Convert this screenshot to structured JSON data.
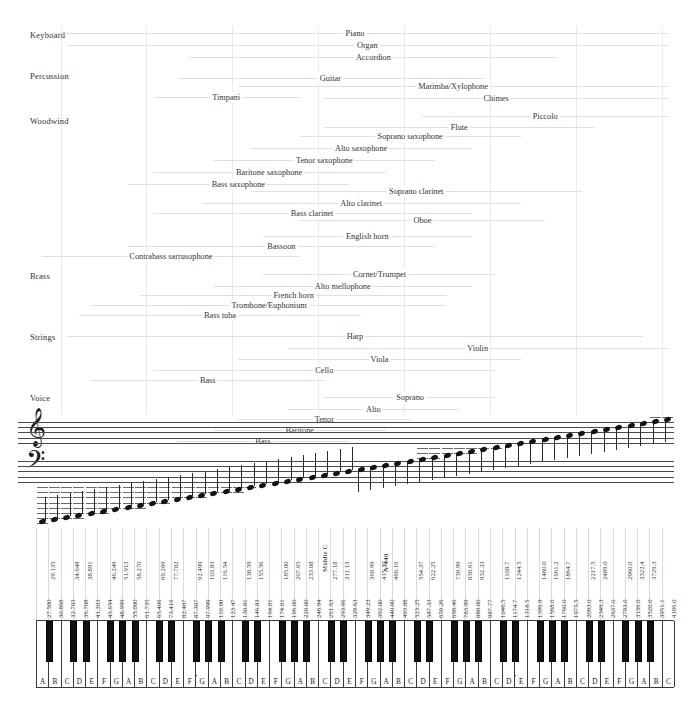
{
  "chart_data": {
    "type": "table",
    "xlabel": "Pitch (piano keys A0–C8)",
    "ylabel": "Instrument family",
    "grid": true,
    "legend": "none",
    "categories_axis": [
      "Keyboard",
      "Percussion",
      "Woodwind",
      "Brass",
      "Strings",
      "Voice"
    ],
    "key_count_white": 52,
    "key_range": [
      "A0",
      "C8"
    ],
    "reference_markers": [
      "Middle C",
      "A-440"
    ],
    "white_key_frequencies_hz": [
      27.5,
      30.868,
      32.703,
      36.708,
      41.203,
      43.654,
      48.999,
      55.0,
      61.735,
      65.406,
      73.416,
      82.407,
      87.307,
      97.999,
      110.0,
      123.47,
      130.81,
      146.83,
      164.81,
      174.61,
      196.0,
      220.0,
      246.94,
      261.63,
      293.66,
      329.63,
      349.23,
      392.0,
      440.0,
      493.88,
      523.25,
      587.33,
      659.26,
      698.46,
      783.99,
      880.0,
      987.77,
      1046.5,
      1174.7,
      1318.5,
      1396.9,
      1568.0,
      1760.0,
      1975.5,
      2093.0,
      2349.3,
      2637.0,
      2793.0,
      3136.0,
      3520.0,
      3951.1,
      4186.0
    ],
    "black_key_frequencies_hz": [
      29.135,
      34.648,
      38.891,
      46.249,
      51.913,
      58.27,
      69.269,
      77.782,
      92.499,
      103.83,
      116.54,
      138.59,
      155.56,
      185.0,
      207.65,
      233.08,
      277.18,
      311.13,
      369.99,
      415.3,
      466.16,
      554.37,
      622.25,
      739.99,
      830.61,
      932.33,
      1108.7,
      1244.5,
      1480.0,
      1661.2,
      1864.7,
      2217.5,
      2489.0,
      2960.0,
      3322.4,
      3729.3
    ],
    "note_letters_sequence": [
      "A",
      "B",
      "C",
      "D",
      "E",
      "F",
      "G",
      "A",
      "B",
      "C",
      "D",
      "E",
      "F",
      "G",
      "A",
      "B",
      "C",
      "D",
      "E",
      "F",
      "G",
      "A",
      "B",
      "C",
      "D",
      "E",
      "F",
      "G",
      "A",
      "B",
      "C",
      "D",
      "E",
      "F",
      "G",
      "A",
      "B",
      "C",
      "D",
      "E",
      "F",
      "G",
      "A",
      "B",
      "C",
      "D",
      "E",
      "F",
      "G",
      "A",
      "B",
      "C"
    ],
    "instrument_ranges": [
      {
        "name": "Piano",
        "category": "Keyboard",
        "low": "A0",
        "high": "C8",
        "low_hz": 27.5,
        "high_hz": 4186.0
      },
      {
        "name": "Organ",
        "category": "Keyboard",
        "low": "C1",
        "high": "C8",
        "low_hz": 32.7,
        "high_hz": 4186.0
      },
      {
        "name": "Accordion",
        "category": "Keyboard",
        "low": "F2",
        "high": "A6",
        "low_hz": 87.3,
        "high_hz": 1760.0
      },
      {
        "name": "Guitar",
        "category": "Percussion",
        "low": "E2",
        "high": "B5",
        "low_hz": 82.4,
        "high_hz": 987.8
      },
      {
        "name": "Marimba/Xylophone",
        "category": "Percussion",
        "low": "C3",
        "high": "C8",
        "low_hz": 130.8,
        "high_hz": 4186.0
      },
      {
        "name": "Chimes",
        "category": "Percussion",
        "low": "C4",
        "high": "C8",
        "low_hz": 261.6,
        "high_hz": 4186.0
      },
      {
        "name": "Timpani",
        "category": "Percussion",
        "low": "D2",
        "high": "A3",
        "low_hz": 73.4,
        "high_hz": 220.0
      },
      {
        "name": "Piccolo",
        "category": "Woodwind",
        "low": "D5",
        "high": "C8",
        "low_hz": 587.3,
        "high_hz": 4186.0
      },
      {
        "name": "Flute",
        "category": "Woodwind",
        "low": "C4",
        "high": "D7",
        "low_hz": 261.6,
        "high_hz": 2349.3
      },
      {
        "name": "Soprano saxophone",
        "category": "Woodwind",
        "low": "A3",
        "high": "E6",
        "low_hz": 220.0,
        "high_hz": 1318.5
      },
      {
        "name": "Alto saxophone",
        "category": "Woodwind",
        "low": "D3",
        "high": "A5",
        "low_hz": 146.8,
        "high_hz": 880.0
      },
      {
        "name": "Tenor saxophone",
        "category": "Woodwind",
        "low": "A2",
        "high": "E5",
        "low_hz": 110.0,
        "high_hz": 659.3
      },
      {
        "name": "Baritone saxophone",
        "category": "Woodwind",
        "low": "D2",
        "high": "A4",
        "low_hz": 73.4,
        "high_hz": 440.0
      },
      {
        "name": "Bass saxophone",
        "category": "Woodwind",
        "low": "A1",
        "high": "E4",
        "low_hz": 55.0,
        "high_hz": 329.6
      },
      {
        "name": "Soprano clarinet",
        "category": "Woodwind",
        "low": "D3",
        "high": "C7",
        "low_hz": 146.8,
        "high_hz": 2093.0
      },
      {
        "name": "Alto clarinet",
        "category": "Woodwind",
        "low": "G2",
        "high": "E6",
        "low_hz": 98.0,
        "high_hz": 1318.5
      },
      {
        "name": "Bass clarinet",
        "category": "Woodwind",
        "low": "D2",
        "high": "A5",
        "low_hz": 73.4,
        "high_hz": 880.0
      },
      {
        "name": "Oboe",
        "category": "Woodwind",
        "low": "A3",
        "high": "G6",
        "low_hz": 220.0,
        "high_hz": 1568.0
      },
      {
        "name": "English horn",
        "category": "Woodwind",
        "low": "E3",
        "high": "A5",
        "low_hz": 164.8,
        "high_hz": 880.0
      },
      {
        "name": "Bassoon",
        "category": "Woodwind",
        "low": "A1",
        "high": "E5",
        "low_hz": 55.0,
        "high_hz": 659.3
      },
      {
        "name": "Contrabass sarrusophone",
        "category": "Woodwind",
        "low": "A0",
        "high": "A3",
        "low_hz": 27.5,
        "high_hz": 220.0
      },
      {
        "name": "Cornet/Trumpet",
        "category": "Brass",
        "low": "E3",
        "high": "C6",
        "low_hz": 164.8,
        "high_hz": 1046.5
      },
      {
        "name": "Alto mellophone",
        "category": "Brass",
        "low": "A2",
        "high": "A5",
        "low_hz": 110.0,
        "high_hz": 880.0
      },
      {
        "name": "French horn",
        "category": "Brass",
        "low": "B1",
        "high": "F5",
        "low_hz": 61.7,
        "high_hz": 698.5
      },
      {
        "name": "Trombone/Euphonium",
        "category": "Brass",
        "low": "E1",
        "high": "F5",
        "low_hz": 41.2,
        "high_hz": 698.5
      },
      {
        "name": "Bass tuba",
        "category": "Brass",
        "low": "D1",
        "high": "F4",
        "low_hz": 36.7,
        "high_hz": 349.2
      },
      {
        "name": "Harp",
        "category": "Strings",
        "low": "C1",
        "high": "G7",
        "low_hz": 32.7,
        "high_hz": 3136.0
      },
      {
        "name": "Violin",
        "category": "Strings",
        "low": "G3",
        "high": "C8",
        "low_hz": 196.0,
        "high_hz": 4186.0
      },
      {
        "name": "Viola",
        "category": "Strings",
        "low": "C3",
        "high": "E6",
        "low_hz": 130.8,
        "high_hz": 1318.5
      },
      {
        "name": "Cello",
        "category": "Strings",
        "low": "C2",
        "high": "C6",
        "low_hz": 65.4,
        "high_hz": 1046.5
      },
      {
        "name": "Bass",
        "category": "Strings",
        "low": "E1",
        "high": "C4",
        "low_hz": 41.2,
        "high_hz": 261.6
      },
      {
        "name": "Soprano",
        "category": "Voice",
        "low": "C4",
        "high": "C6",
        "low_hz": 261.6,
        "high_hz": 1046.5
      },
      {
        "name": "Alto",
        "category": "Voice",
        "low": "G3",
        "high": "G5",
        "low_hz": 196.0,
        "high_hz": 784.0
      },
      {
        "name": "Tenor",
        "category": "Voice",
        "low": "C3",
        "high": "C5",
        "low_hz": 130.8,
        "high_hz": 523.3
      },
      {
        "name": "Baritone",
        "category": "Voice",
        "low": "A2",
        "high": "A4",
        "low_hz": 110.0,
        "high_hz": 440.0
      },
      {
        "name": "Bass",
        "category": "Voice",
        "low": "E2",
        "high": "E4",
        "low_hz": 82.4,
        "high_hz": 329.6
      }
    ]
  },
  "categories": [
    {
      "label": "Keyboard",
      "top": 30
    },
    {
      "label": "Percussion",
      "top": 71
    },
    {
      "label": "Woodwind",
      "top": 116
    },
    {
      "label": "Brass",
      "top": 271
    },
    {
      "label": "Strings",
      "top": 332
    },
    {
      "label": "Voice",
      "top": 393
    }
  ],
  "ranges": [
    {
      "name": "Piano",
      "top": 28,
      "a": 0,
      "b": 51
    },
    {
      "name": "Organ",
      "top": 40,
      "a": 2,
      "b": 51
    },
    {
      "name": "Accordion",
      "top": 52,
      "a": 12,
      "b": 42
    },
    {
      "name": "Guitar",
      "top": 73,
      "a": 11,
      "b": 36
    },
    {
      "name": "Marimba/Xylophone",
      "top": 81,
      "a": 16,
      "b": 51
    },
    {
      "name": "Chimes",
      "top": 93,
      "a": 23,
      "b": 51
    },
    {
      "name": "Timpani",
      "top": 92,
      "a": 9,
      "b": 21
    },
    {
      "name": "Piccolo",
      "top": 111,
      "a": 31,
      "b": 51
    },
    {
      "name": "Flute",
      "top": 122,
      "a": 23,
      "b": 45
    },
    {
      "name": "Soprano saxophone",
      "top": 131,
      "a": 21,
      "b": 39
    },
    {
      "name": "Alto saxophone",
      "top": 143,
      "a": 17,
      "b": 35
    },
    {
      "name": "Tenor saxophone",
      "top": 155,
      "a": 14,
      "b": 32
    },
    {
      "name": "Baritone saxophone",
      "top": 167,
      "a": 9,
      "b": 28
    },
    {
      "name": "Bass saxophone",
      "top": 179,
      "a": 7,
      "b": 25
    },
    {
      "name": "Soprano clarinet",
      "top": 186,
      "a": 17,
      "b": 44
    },
    {
      "name": "Alto clarinet",
      "top": 198,
      "a": 13,
      "b": 39
    },
    {
      "name": "Bass clarinet",
      "top": 208,
      "a": 9,
      "b": 35
    },
    {
      "name": "Oboe",
      "top": 215,
      "a": 21,
      "b": 41
    },
    {
      "name": "English horn",
      "top": 231,
      "a": 18,
      "b": 35
    },
    {
      "name": "Bassoon",
      "top": 241,
      "a": 7,
      "b": 32
    },
    {
      "name": "Contrabass sarrusophone",
      "top": 251,
      "a": 0,
      "b": 21
    },
    {
      "name": "Cornet/Trumpet",
      "top": 269,
      "a": 18,
      "b": 37
    },
    {
      "name": "Alto mellophone",
      "top": 281,
      "a": 14,
      "b": 35
    },
    {
      "name": "French horn",
      "top": 290,
      "a": 8,
      "b": 33
    },
    {
      "name": "Trombone/Euphonium",
      "top": 300,
      "a": 4,
      "b": 33
    },
    {
      "name": "Bass tuba",
      "top": 310,
      "a": 3,
      "b": 26
    },
    {
      "name": "Harp",
      "top": 331,
      "a": 2,
      "b": 49
    },
    {
      "name": "Violin",
      "top": 343,
      "a": 20,
      "b": 51
    },
    {
      "name": "Viola",
      "top": 354,
      "a": 16,
      "b": 39
    },
    {
      "name": "Cello",
      "top": 365,
      "a": 9,
      "b": 37
    },
    {
      "name": "Bass",
      "top": 375,
      "a": 4,
      "b": 23
    },
    {
      "name": "Soprano",
      "top": 392,
      "a": 23,
      "b": 37
    },
    {
      "name": "Alto",
      "top": 404,
      "a": 20,
      "b": 34
    },
    {
      "name": "Tenor",
      "top": 414,
      "a": 16,
      "b": 30
    },
    {
      "name": "Baritone",
      "top": 425,
      "a": 14,
      "b": 28
    },
    {
      "name": "Bass",
      "top": 436,
      "a": 11,
      "b": 25
    }
  ],
  "staff": {
    "treble_clef_glyph": "𝄞",
    "bass_clef_glyph": "𝄢"
  },
  "markers": {
    "middle_c": "Middle C",
    "a440": "A-440"
  },
  "white_keys": [
    {
      "letter": "A",
      "hz": "27.500"
    },
    {
      "letter": "B",
      "hz": "30.868"
    },
    {
      "letter": "C",
      "hz": "32.703"
    },
    {
      "letter": "D",
      "hz": "36.708"
    },
    {
      "letter": "E",
      "hz": "41.203"
    },
    {
      "letter": "F",
      "hz": "43.654"
    },
    {
      "letter": "G",
      "hz": "48.999"
    },
    {
      "letter": "A",
      "hz": "55.000"
    },
    {
      "letter": "B",
      "hz": "61.735"
    },
    {
      "letter": "C",
      "hz": "65.406"
    },
    {
      "letter": "D",
      "hz": "73.416"
    },
    {
      "letter": "E",
      "hz": "82.407"
    },
    {
      "letter": "F",
      "hz": "87.307"
    },
    {
      "letter": "G",
      "hz": "97.999"
    },
    {
      "letter": "A",
      "hz": "110.00"
    },
    {
      "letter": "B",
      "hz": "123.47"
    },
    {
      "letter": "C",
      "hz": "130.81"
    },
    {
      "letter": "D",
      "hz": "146.83"
    },
    {
      "letter": "E",
      "hz": "164.81"
    },
    {
      "letter": "F",
      "hz": "174.61"
    },
    {
      "letter": "G",
      "hz": "196.00"
    },
    {
      "letter": "A",
      "hz": "220.00"
    },
    {
      "letter": "B",
      "hz": "246.94"
    },
    {
      "letter": "C",
      "hz": "261.63"
    },
    {
      "letter": "D",
      "hz": "293.66"
    },
    {
      "letter": "E",
      "hz": "329.63"
    },
    {
      "letter": "F",
      "hz": "349.23"
    },
    {
      "letter": "G",
      "hz": "392.00"
    },
    {
      "letter": "A",
      "hz": "440.00"
    },
    {
      "letter": "B",
      "hz": "493.88"
    },
    {
      "letter": "C",
      "hz": "523.25"
    },
    {
      "letter": "D",
      "hz": "587.33"
    },
    {
      "letter": "E",
      "hz": "659.26"
    },
    {
      "letter": "F",
      "hz": "698.46"
    },
    {
      "letter": "G",
      "hz": "783.99"
    },
    {
      "letter": "A",
      "hz": "880.00"
    },
    {
      "letter": "B",
      "hz": "987.77"
    },
    {
      "letter": "C",
      "hz": "1046.5"
    },
    {
      "letter": "D",
      "hz": "1174.7"
    },
    {
      "letter": "E",
      "hz": "1318.5"
    },
    {
      "letter": "F",
      "hz": "1396.9"
    },
    {
      "letter": "G",
      "hz": "1568.0"
    },
    {
      "letter": "A",
      "hz": "1760.0"
    },
    {
      "letter": "B",
      "hz": "1975.5"
    },
    {
      "letter": "C",
      "hz": "2093.0"
    },
    {
      "letter": "D",
      "hz": "2349.3"
    },
    {
      "letter": "E",
      "hz": "2637.0"
    },
    {
      "letter": "F",
      "hz": "2793.0"
    },
    {
      "letter": "G",
      "hz": "3136.0"
    },
    {
      "letter": "A",
      "hz": "3520.0"
    },
    {
      "letter": "B",
      "hz": "3951.1"
    },
    {
      "letter": "C",
      "hz": "4186.0"
    }
  ],
  "black_keys": [
    {
      "after": 0,
      "hz": "29.135"
    },
    {
      "after": 2,
      "hz": "34.648"
    },
    {
      "after": 3,
      "hz": "38.891"
    },
    {
      "after": 5,
      "hz": "46.249"
    },
    {
      "after": 6,
      "hz": "51.913"
    },
    {
      "after": 7,
      "hz": "58.270"
    },
    {
      "after": 9,
      "hz": "69.269"
    },
    {
      "after": 10,
      "hz": "77.782"
    },
    {
      "after": 12,
      "hz": "92.499"
    },
    {
      "after": 13,
      "hz": "103.83"
    },
    {
      "after": 14,
      "hz": "116.54"
    },
    {
      "after": 16,
      "hz": "138.59"
    },
    {
      "after": 17,
      "hz": "155.56"
    },
    {
      "after": 19,
      "hz": "185.00"
    },
    {
      "after": 20,
      "hz": "207.65"
    },
    {
      "after": 21,
      "hz": "233.08"
    },
    {
      "after": 23,
      "hz": "277.18"
    },
    {
      "after": 24,
      "hz": "311.13"
    },
    {
      "after": 26,
      "hz": "369.99"
    },
    {
      "after": 27,
      "hz": "415.30"
    },
    {
      "after": 28,
      "hz": "466.16"
    },
    {
      "after": 30,
      "hz": "554.37"
    },
    {
      "after": 31,
      "hz": "622.25"
    },
    {
      "after": 33,
      "hz": "739.99"
    },
    {
      "after": 34,
      "hz": "830.61"
    },
    {
      "after": 35,
      "hz": "932.33"
    },
    {
      "after": 37,
      "hz": "1108.7"
    },
    {
      "after": 38,
      "hz": "1244.5"
    },
    {
      "after": 40,
      "hz": "1480.0"
    },
    {
      "after": 41,
      "hz": "1661.2"
    },
    {
      "after": 42,
      "hz": "1864.7"
    },
    {
      "after": 44,
      "hz": "2217.5"
    },
    {
      "after": 45,
      "hz": "2489.0"
    },
    {
      "after": 47,
      "hz": "2960.0"
    },
    {
      "after": 48,
      "hz": "3322.4"
    },
    {
      "after": 49,
      "hz": "3729.3"
    }
  ]
}
